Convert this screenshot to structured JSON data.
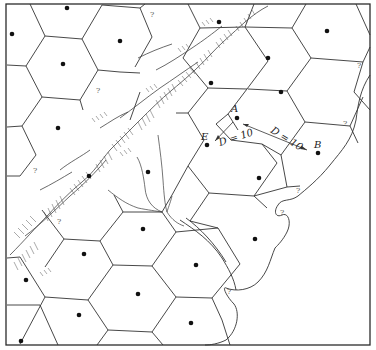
{
  "figure": {
    "type": "central-place hexagonal market areas map",
    "labels": {
      "a": "A",
      "b": "B",
      "e": "E",
      "distance_ea": "D = 10",
      "distance_ab": "D = 10",
      "unknown": "?"
    },
    "colors": {
      "line": "#333333",
      "dot": "#111111",
      "background": "#ffffff"
    }
  }
}
